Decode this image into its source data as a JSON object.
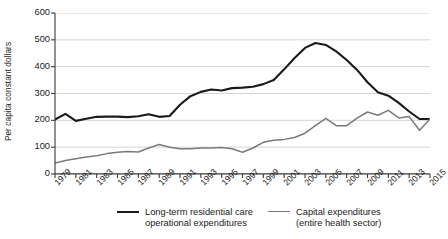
{
  "chart_data": {
    "type": "line",
    "title": "",
    "xlabel": "",
    "ylabel": "Per capita constant dollars",
    "ylim": [
      0,
      600
    ],
    "yticks": [
      0,
      100,
      200,
      300,
      400,
      500,
      600
    ],
    "grid": true,
    "legend_position": "bottom",
    "x": [
      1979,
      1980,
      1981,
      1982,
      1983,
      1984,
      1985,
      1986,
      1987,
      1988,
      1989,
      1990,
      1991,
      1992,
      1993,
      1994,
      1995,
      1996,
      1997,
      1998,
      1999,
      2000,
      2001,
      2002,
      2003,
      2004,
      2005,
      2006,
      2007,
      2008,
      2009,
      2010,
      2011,
      2012,
      2013,
      2014,
      2015
    ],
    "xtick_labels": [
      "1979",
      "1981",
      "1983",
      "1985",
      "1987",
      "1989",
      "1991",
      "1993",
      "1995",
      "1997",
      "1999",
      "2001",
      "2003",
      "2005",
      "2007",
      "2009",
      "2011",
      "2013",
      "2015"
    ],
    "series": [
      {
        "name": "Long-term residential care operational expenditures",
        "color": "#1a1a1a",
        "width": 2.1,
        "values": [
          203,
          224,
          198,
          206,
          213,
          214,
          214,
          212,
          215,
          223,
          213,
          216,
          258,
          290,
          306,
          315,
          311,
          320,
          322,
          325,
          335,
          350,
          390,
          432,
          470,
          488,
          481,
          457,
          425,
          388,
          342,
          305,
          292,
          265,
          233,
          205,
          205
        ]
      },
      {
        "name": "Capital expenditures (entire health sector)",
        "color": "#7a7a7a",
        "width": 1.5,
        "values": [
          41,
          50,
          57,
          63,
          68,
          76,
          81,
          84,
          82,
          97,
          110,
          100,
          94,
          94,
          97,
          97,
          99,
          94,
          81,
          97,
          118,
          126,
          129,
          136,
          152,
          180,
          207,
          180,
          180,
          208,
          231,
          219,
          237,
          209,
          214,
          163,
          205
        ]
      }
    ]
  },
  "legend": [
    {
      "label": "Long-term residential care\noperational expenditures",
      "color": "#1a1a1a",
      "swatch": "line-swatch-black"
    },
    {
      "label": "Capital expenditures\n(entire health sector)",
      "color": "#7a7a7a",
      "swatch": "line-swatch-gray"
    }
  ]
}
